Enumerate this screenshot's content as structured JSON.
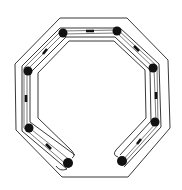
{
  "diagram": {
    "type": "line-drawing",
    "colors": {
      "background": "#ffffff",
      "stroke": "#222222",
      "node": "#111111"
    },
    "outer_octagon": [
      [
        60,
        18
      ],
      [
        127,
        18
      ],
      [
        168,
        60
      ],
      [
        170,
        128
      ],
      [
        128,
        177
      ],
      [
        62,
        177
      ],
      [
        16,
        130
      ],
      [
        15,
        64
      ]
    ],
    "inner_channel_outer": [
      [
        63,
        27
      ],
      [
        118,
        27
      ],
      [
        158,
        65
      ],
      [
        160,
        124
      ],
      [
        121,
        158
      ]
    ],
    "inner_channel_inner": [
      [
        70,
        39
      ],
      [
        114,
        39
      ],
      [
        147,
        70
      ],
      [
        147,
        118
      ],
      [
        117,
        152
      ]
    ],
    "nodes": [
      [
        63,
        33
      ],
      [
        117,
        31
      ],
      [
        153,
        68
      ],
      [
        155,
        122
      ],
      [
        122,
        161
      ],
      [
        68,
        163
      ],
      [
        29,
        128
      ],
      [
        28,
        71
      ]
    ],
    "dashes": [
      [
        90,
        31
      ],
      [
        137,
        49
      ],
      [
        156,
        96
      ],
      [
        139,
        142
      ],
      [
        49,
        147
      ],
      [
        27,
        98
      ],
      [
        45,
        51
      ]
    ]
  }
}
